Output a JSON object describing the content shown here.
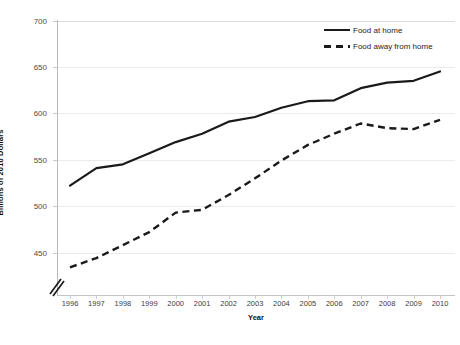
{
  "chart_data": {
    "type": "line",
    "title": "",
    "subtitle": "",
    "xlabel": "Year",
    "ylabel": "Billions of 2010 Dollars",
    "x": [
      1996,
      1997,
      1998,
      1999,
      2000,
      2001,
      2002,
      2003,
      2004,
      2005,
      2006,
      2007,
      2008,
      2009,
      2010
    ],
    "xtick_labels": [
      "1996",
      "1997",
      "1998",
      "1999",
      "2000",
      "2001",
      "2002",
      "2003",
      "2004",
      "2005",
      "2006",
      "2007",
      "2008",
      "2009",
      "2010"
    ],
    "ytick_labels": [
      "450",
      "500",
      "550",
      "600",
      "650",
      "700"
    ],
    "yticks": [
      450,
      500,
      550,
      600,
      650,
      700
    ],
    "ylim": [
      425,
      700
    ],
    "xlim": [
      1996,
      2010
    ],
    "y_axis_break": true,
    "grid": "horizontal",
    "legend_position": "top-right",
    "series": [
      {
        "name": "Food at home",
        "style": "solid",
        "color": "#1a1a1a",
        "values": [
          522,
          541,
          545,
          557,
          569,
          578,
          591,
          596,
          606,
          613,
          614,
          627,
          633,
          635,
          645
        ]
      },
      {
        "name": "Food away from home",
        "style": "dashed",
        "color": "#1a1a1a",
        "values": [
          434,
          444,
          458,
          472,
          493,
          496,
          512,
          530,
          549,
          566,
          578,
          589,
          584,
          583,
          593
        ]
      }
    ]
  },
  "legend": {
    "entries": [
      {
        "label": "Food at home",
        "style": "solid"
      },
      {
        "label": "Food away from home",
        "style": "dashed"
      }
    ]
  },
  "colors": {
    "line": "#1a1a1a",
    "gridline": "#ebebeb",
    "axis": "#b9b9b9",
    "tick_text": "#4d4d4d",
    "background": "#ffffff"
  }
}
